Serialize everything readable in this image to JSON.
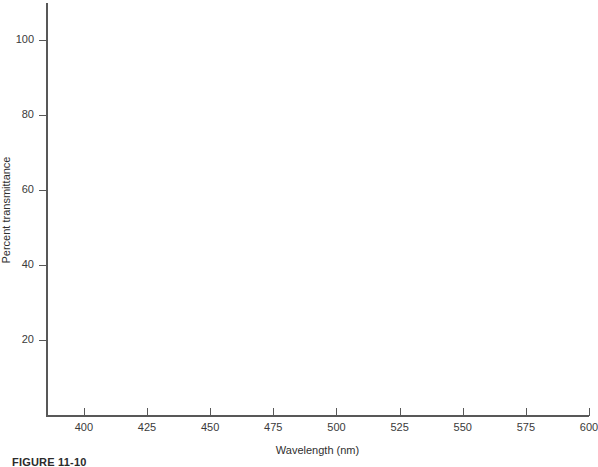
{
  "figure": {
    "caption": "FIGURE 11-10"
  },
  "chart_data": {
    "type": "line",
    "title": "",
    "subtitle": "",
    "xlabel": "Wavelength (nm)",
    "ylabel": "Percent transmittance",
    "xlim": [
      385,
      600
    ],
    "ylim": [
      0,
      110
    ],
    "xticks": [
      400,
      425,
      450,
      475,
      500,
      525,
      550,
      575,
      600
    ],
    "xtick_labels": [
      "400",
      "425",
      "450",
      "475",
      "500",
      "525",
      "550",
      "575",
      "600"
    ],
    "yticks": [
      20,
      40,
      60,
      80,
      100
    ],
    "ytick_labels": [
      "20",
      "40",
      "60",
      "80",
      "100"
    ],
    "grid": false,
    "legend": null,
    "series": [],
    "annotations": [],
    "note": "blank axes template - no data plotted",
    "axis_color": "#585858",
    "text_color": "#3a3a3a",
    "background": "#ffffff"
  }
}
